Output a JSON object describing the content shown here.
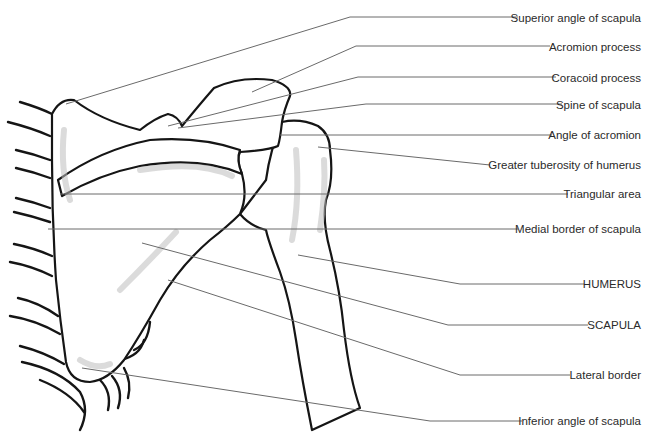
{
  "figure": {
    "labels": [
      {
        "id": "superior-angle",
        "text": "Superior angle of scapula",
        "y": 18
      },
      {
        "id": "acromion-process",
        "text": "Acromion process",
        "y": 47
      },
      {
        "id": "coracoid-process",
        "text": "Coracoid process",
        "y": 78
      },
      {
        "id": "spine-of-scapula",
        "text": "Spine of scapula",
        "y": 106
      },
      {
        "id": "angle-of-acromion",
        "text": "Angle of acromion",
        "y": 135
      },
      {
        "id": "greater-tuberosity",
        "text": "Greater tuberosity of humerus",
        "y": 165
      },
      {
        "id": "triangular-area",
        "text": "Triangular area",
        "y": 194
      },
      {
        "id": "medial-border",
        "text": "Medial border of scapula",
        "y": 230
      },
      {
        "id": "humerus",
        "text": "HUMERUS",
        "y": 285
      },
      {
        "id": "scapula",
        "text": "SCAPULA",
        "y": 325
      },
      {
        "id": "lateral-border",
        "text": "Lateral border",
        "y": 375
      },
      {
        "id": "inferior-angle",
        "text": "Inferior angle of scapula",
        "y": 421
      }
    ]
  }
}
